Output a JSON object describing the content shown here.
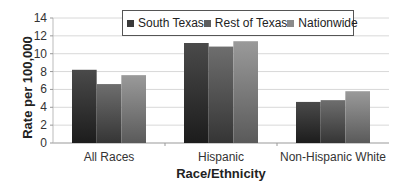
{
  "chart_data": {
    "type": "bar",
    "title": "",
    "xlabel": "Race/Ethnicity",
    "ylabel": "Rate per 100,000",
    "categories": [
      "All Races",
      "Hispanic",
      "Non-Hispanic White"
    ],
    "series": [
      {
        "name": "South Texas",
        "values": [
          8.2,
          11.2,
          4.6
        ],
        "color": "#3a3a3a"
      },
      {
        "name": "Rest of Texas",
        "values": [
          6.6,
          10.8,
          4.8
        ],
        "color": "#5e5e5e"
      },
      {
        "name": "Nationwide",
        "values": [
          7.6,
          11.4,
          5.8
        ],
        "color": "#8a8a8a"
      }
    ],
    "ylim": [
      0,
      14
    ],
    "yticks": [
      0,
      2,
      4,
      6,
      8,
      10,
      12,
      14
    ],
    "grid": true,
    "legend_position": "top"
  },
  "legend": {
    "items": [
      {
        "label": "South Texas",
        "color": "#3a3a3a"
      },
      {
        "label": "Rest of Texas",
        "color": "#5e5e5e"
      },
      {
        "label": "Nationwide",
        "color": "#8a8a8a"
      }
    ]
  },
  "axes": {
    "xlabel": "Race/Ethnicity",
    "ylabel": "Rate per 100,000"
  }
}
